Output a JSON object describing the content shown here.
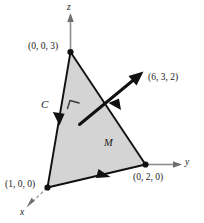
{
  "figure": {
    "colors": {
      "surface_fill": "#d4d4d4",
      "edge_stroke": "#111111",
      "axis_stroke": "#8c8c8c",
      "dashed_stroke": "#9a9a9a",
      "label_text": "#1a1a1a",
      "background": "#ffffff"
    },
    "axes": [
      {
        "name": "z-axis",
        "label": "z"
      },
      {
        "name": "y-axis",
        "label": "y"
      },
      {
        "name": "x-axis",
        "label": "x"
      }
    ],
    "vertices": [
      {
        "name": "vertex-z",
        "label": "(0, 0, 3)",
        "point": [
          0,
          0,
          3
        ]
      },
      {
        "name": "vertex-x",
        "label": "(1, 0, 0)",
        "point": [
          1,
          0,
          0
        ]
      },
      {
        "name": "vertex-y",
        "label": "(0, 2, 0)",
        "point": [
          0,
          2,
          0
        ]
      }
    ],
    "normal_vector": {
      "name": "normal-vector",
      "label": "(6, 3, 2)",
      "components": [
        6,
        3,
        2
      ]
    },
    "surface": {
      "name": "surface-M",
      "label": "M"
    },
    "boundary_curve": {
      "name": "boundary-curve-C",
      "label": "C"
    },
    "right_angle": {
      "name": "right-angle-marker",
      "label": ""
    }
  }
}
